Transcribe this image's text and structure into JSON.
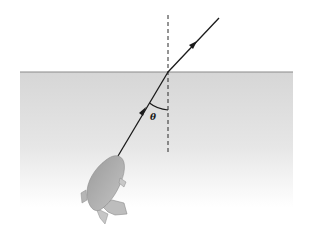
{
  "diagram": {
    "labels": {
      "angle": "θ"
    },
    "colors": {
      "background": "#ffffff",
      "water_top": "#d9d9d9",
      "water_bottom": "#ffffff",
      "surface_line": "#8a8a8a",
      "ray": "#1a1a1a",
      "normal": "#2a2a2a",
      "fish_body": "#a8a8a8"
    },
    "elements": [
      {
        "name": "water-surface",
        "description": "horizontal air-water boundary"
      },
      {
        "name": "normal-line",
        "description": "dashed vertical normal at point of incidence"
      },
      {
        "name": "incident-ray",
        "description": "ray travelling from fish up to surface"
      },
      {
        "name": "refracted-ray",
        "description": "ray bent away from normal in air"
      },
      {
        "name": "angle-theta",
        "description": "angle between incident ray and normal"
      },
      {
        "name": "fish",
        "description": "fish illustration in water"
      }
    ]
  }
}
